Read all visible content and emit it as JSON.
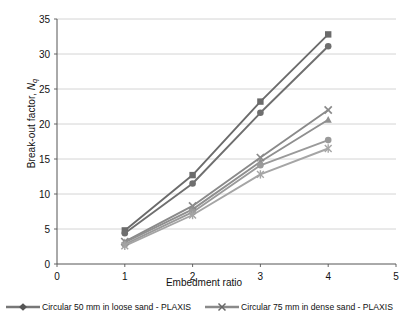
{
  "chart_data": {
    "type": "line",
    "title": "",
    "xlabel": "Embedment ratio",
    "ylabel": "Break-out factor, Nq",
    "x": [
      1,
      2,
      3,
      4
    ],
    "xlim": [
      0,
      5
    ],
    "ylim": [
      0,
      35
    ],
    "xticks": [
      "0",
      "1",
      "2",
      "3",
      "4",
      "5"
    ],
    "yticks": [
      "0",
      "5",
      "10",
      "15",
      "20",
      "25",
      "30",
      "35"
    ],
    "grid": "horizontal",
    "legend_position": "bottom",
    "series": [
      {
        "name": "Square 50 mm in dense sand - PLAXIS",
        "marker": "square",
        "color": "#6b6b6b",
        "values": [
          4.8,
          12.7,
          23.2,
          32.8
        ]
      },
      {
        "name": "Circular 50 mm in dense sand - PLAXIS",
        "marker": "circle",
        "color": "#6f6f6f",
        "values": [
          4.4,
          11.5,
          21.6,
          31.1
        ]
      },
      {
        "name": "Circular 75 mm in dense sand - PLAXIS",
        "marker": "cross",
        "color": "#8a8a8a",
        "values": [
          3.2,
          8.3,
          15.2,
          22.0
        ]
      },
      {
        "name": "Square 75 mm in loose sand - PLAXIS",
        "marker": "triangle",
        "color": "#8f8f8f",
        "values": [
          3.1,
          7.8,
          14.6,
          20.6
        ]
      },
      {
        "name": "Circular 50 mm in loose sand - PLAXIS",
        "marker": "circle",
        "color": "#9a9a9a",
        "values": [
          2.8,
          7.4,
          14.1,
          17.7
        ]
      },
      {
        "name": "Circular 75 mm in loose sand - PLAXIS",
        "marker": "star",
        "color": "#a5a5a5",
        "values": [
          2.6,
          7.0,
          12.8,
          16.5
        ]
      }
    ],
    "legend_entries": [
      {
        "label": "Circular 50 mm in loose sand - PLAXIS",
        "marker": "diamond",
        "color": "#777777"
      },
      {
        "label": "Circular 75 mm in dense sand - PLAXIS",
        "marker": "cross",
        "color": "#8a8a8a"
      }
    ]
  }
}
